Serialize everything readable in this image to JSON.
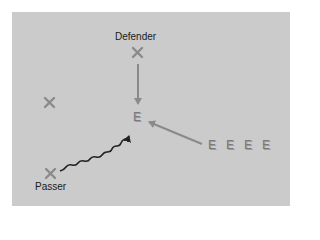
{
  "diagram": {
    "type": "play-diagram",
    "labels": {
      "defender": "Defender",
      "passer": "Passer"
    },
    "players": [
      {
        "role": "defender",
        "symbol": "X",
        "x": 137,
        "y": 52
      },
      {
        "role": "unlabeled",
        "symbol": "X",
        "x": 49,
        "y": 102
      },
      {
        "role": "passer",
        "symbol": "X",
        "x": 50,
        "y": 173
      }
    ],
    "eligible": [
      {
        "symbol": "E",
        "x": 134,
        "y": 116,
        "role": "target"
      },
      {
        "symbol": "E",
        "x": 208,
        "y": 140
      },
      {
        "symbol": "E",
        "x": 226,
        "y": 140
      },
      {
        "symbol": "E",
        "x": 244,
        "y": 140
      },
      {
        "symbol": "E",
        "x": 262,
        "y": 140
      }
    ],
    "arrows": [
      {
        "kind": "straight",
        "from": "defender",
        "to": "target",
        "color": "#8a8a8a"
      },
      {
        "kind": "straight",
        "from": "E-line",
        "to": "target",
        "color": "#8a8a8a"
      },
      {
        "kind": "wavy",
        "from": "passer",
        "to": "target",
        "color": "#222222"
      }
    ],
    "colors": {
      "background": "#cbcbcb",
      "marker": "#8a8a8a",
      "pass": "#222222"
    }
  }
}
